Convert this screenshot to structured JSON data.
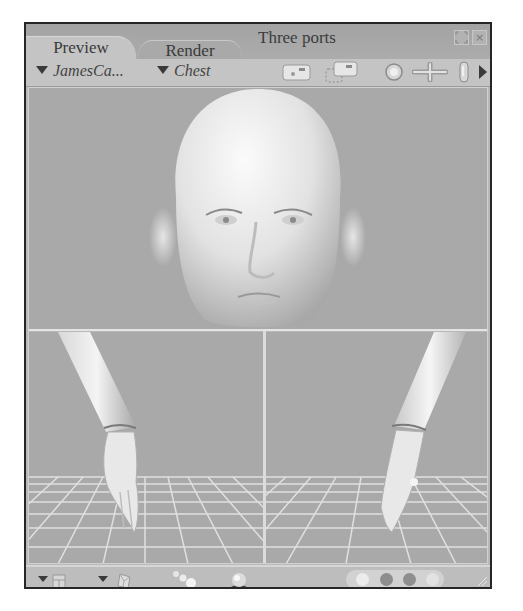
{
  "window": {
    "title": "Three ports",
    "tabs": [
      {
        "label": "Preview",
        "active": true
      },
      {
        "label": "Render",
        "active": false
      }
    ],
    "controls": [
      "maximize-icon",
      "close-icon"
    ],
    "close_glyph": "×",
    "maximize_glyph": "⛶"
  },
  "toolbar": {
    "figure_dropdown": "JamesCa...",
    "part_dropdown": "Chest",
    "icons": [
      "camera-icon",
      "camera-multi-icon",
      "face-camera-icon",
      "move-cross-icon",
      "hand-camera-icon",
      "more-arrow-icon"
    ]
  },
  "viewports": {
    "main": {
      "name": "Face Camera",
      "content": "head-render"
    },
    "left": {
      "name": "Left Hand Camera",
      "content": "left-hand-render"
    },
    "right": {
      "name": "Right Hand Camera",
      "content": "right-hand-render"
    }
  },
  "bottombar": {
    "icons": [
      "document-menu-icon",
      "display-style-icon",
      "lights-icon",
      "ball-render-icon"
    ],
    "tracking_dots": [
      "box-tracking",
      "fast-tracking",
      "full-tracking",
      "full-texture-tracking"
    ]
  },
  "colors": {
    "panel_bg": "#c4c4c4",
    "viewport_bg": "#a9a9a9",
    "grid_line": "#e2e2e2",
    "border": "#262626"
  }
}
